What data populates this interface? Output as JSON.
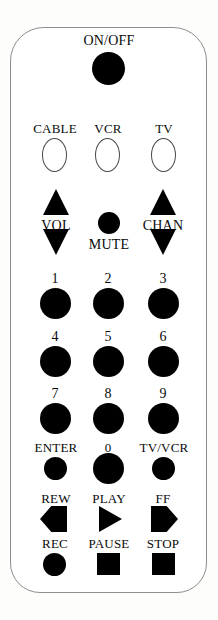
{
  "device": {
    "name": "universal-remote-control",
    "body_color": "#ffffff",
    "outline_color": "#8d8d8d",
    "button_color": "#000000",
    "background_color": "#fdfdfb"
  },
  "power": {
    "label": "ON/OFF",
    "icon": "power-button-circle"
  },
  "mode_buttons": [
    {
      "label": "CABLE",
      "icon": "oval-button"
    },
    {
      "label": "VCR",
      "icon": "oval-button"
    },
    {
      "label": "TV",
      "icon": "oval-button"
    }
  ],
  "volume": {
    "label": "VOL",
    "up_icon": "triangle-up-icon",
    "down_icon": "triangle-down-icon"
  },
  "channel": {
    "label": "CHAN",
    "up_icon": "triangle-up-icon",
    "down_icon": "triangle-down-icon"
  },
  "mute": {
    "label": "MUTE",
    "icon": "round-button"
  },
  "keypad": {
    "rows": [
      [
        {
          "label": "1",
          "icon": "round-button"
        },
        {
          "label": "2",
          "icon": "round-button"
        },
        {
          "label": "3",
          "icon": "round-button"
        }
      ],
      [
        {
          "label": "4",
          "icon": "round-button"
        },
        {
          "label": "5",
          "icon": "round-button"
        },
        {
          "label": "6",
          "icon": "round-button"
        }
      ],
      [
        {
          "label": "7",
          "icon": "round-button"
        },
        {
          "label": "8",
          "icon": "round-button"
        },
        {
          "label": "9",
          "icon": "round-button"
        }
      ]
    ],
    "bottom_row": [
      {
        "label": "ENTER",
        "icon": "round-button"
      },
      {
        "label": "0",
        "icon": "round-button"
      },
      {
        "label": "TV/VCR",
        "icon": "round-button"
      }
    ]
  },
  "transport": {
    "row1": [
      {
        "label": "REW",
        "icon": "rewind-arrow-icon"
      },
      {
        "label": "PLAY",
        "icon": "play-triangle-icon"
      },
      {
        "label": "FF",
        "icon": "fast-forward-arrow-icon"
      }
    ],
    "row2": [
      {
        "label": "REC",
        "icon": "record-circle-icon"
      },
      {
        "label": "PAUSE",
        "icon": "pause-square-icon"
      },
      {
        "label": "STOP",
        "icon": "stop-square-icon"
      }
    ]
  }
}
